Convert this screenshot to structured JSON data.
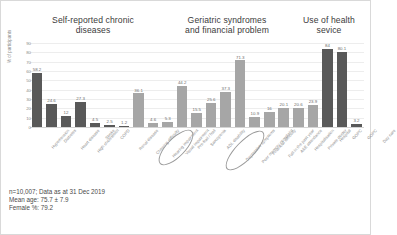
{
  "chart_data": {
    "type": "bar",
    "title": "",
    "xlabel": "",
    "ylabel": "% of participants",
    "ylim": [
      0,
      90
    ],
    "ytick_step": 10,
    "yticks": [
      "0",
      "10",
      "20",
      "30",
      "40",
      "50",
      "60",
      "70",
      "80",
      "90"
    ],
    "grid": true,
    "legend": "none",
    "groups": [
      {
        "title": "Self-reported chronic diseases",
        "color": "#595959",
        "categories": [
          "Hypertension",
          "Diabetes",
          "Heart disease",
          "High cholesterol",
          "Stroke",
          "COPD",
          "Renal disease"
        ],
        "values": [
          58.2,
          24.6,
          12,
          27.3,
          4.5,
          2.5,
          1.2
        ]
      },
      {
        "title": "Geriatric syndromes and financial problem",
        "color": "#a6a6a6",
        "categories": [
          "Chewing difficulty",
          "Hearing impairment",
          "Visual impairment",
          "Pre-frail / frail",
          "Sarcopenia",
          "ADL disability",
          "Depressive symptoms",
          "Poor memory complaint",
          "Financial difficulty"
        ],
        "values": [
          36.1,
          4.6,
          5.3,
          44.2,
          15.5,
          25.6,
          37.3,
          71.3,
          10.9
        ]
      },
      {
        "title": "Use of health sevice",
        "color": "#595959",
        "categories": [
          "Fall in the past year",
          "A&E attendance",
          "Hospitalisation",
          "Private doctor",
          "Hospital",
          "GOPC",
          "GOPC",
          "Day care"
        ],
        "values": [
          16,
          20.1,
          20.6,
          23.9,
          84,
          80.1,
          3.2
        ]
      }
    ],
    "all_categories": [
      "Hypertension",
      "Diabetes",
      "Heart disease",
      "High cholesterol",
      "Stroke",
      "COPD",
      "Renal disease",
      "Chewing difficulty",
      "Hearing impairment",
      "Visual impairment",
      "Pre-frail / frail",
      "Sarcopenia",
      "ADL disability",
      "Depressive symptoms",
      "Poor memory complaint",
      "Financial difficulty",
      "Fall in the past year",
      "A&E attendance",
      "Hospitalisation",
      "Private doctor",
      "Hospital",
      "GOPC",
      "GOPC",
      "Day care"
    ],
    "all_values": [
      58.2,
      24.6,
      12,
      27.3,
      4.5,
      2.5,
      1.2,
      36.1,
      4.6,
      5.3,
      44.2,
      15.5,
      25.6,
      37.3,
      71.3,
      10.9,
      16,
      20.1,
      20.6,
      23.9,
      84,
      80.1,
      3.2
    ],
    "value_labels": [
      "58.2",
      "24.6",
      "12",
      "27.3",
      "4.5",
      "2.5",
      "1.2",
      "36.1",
      "4.6",
      "5.3",
      "44.2",
      "15.5",
      "25.6",
      "37.3",
      "71.3",
      "10.9",
      "16",
      "20.1",
      "20.6",
      "23.9",
      "84",
      "80.1",
      "3.2"
    ],
    "bar_shades": [
      "dark",
      "dark",
      "dark",
      "dark",
      "dark",
      "dark",
      "dark",
      "light",
      "light",
      "light",
      "light",
      "light",
      "light",
      "light",
      "light",
      "light",
      "light",
      "light",
      "light",
      "light",
      "dark",
      "dark",
      "dark"
    ],
    "annotations": [
      {
        "name": "ellipse-pre-frail",
        "target": "Pre-frail / frail"
      },
      {
        "name": "ellipse-poor-memory-complaint",
        "target": "Poor memory complaint"
      }
    ]
  },
  "headings": {
    "section1_line1": "Self-reported chronic",
    "section1_line2": "diseases",
    "section2_line1": "Geriatric syndromes",
    "section2_line2": "and financial problem",
    "section3_line1": "Use of health",
    "section3_line2": "sevice"
  },
  "footnote": {
    "line1": "n=10,007; Data as at 31 Dec 2019",
    "line2": "Mean age: 75.7 ± 7.9",
    "line3": "Female %: 79.2"
  }
}
